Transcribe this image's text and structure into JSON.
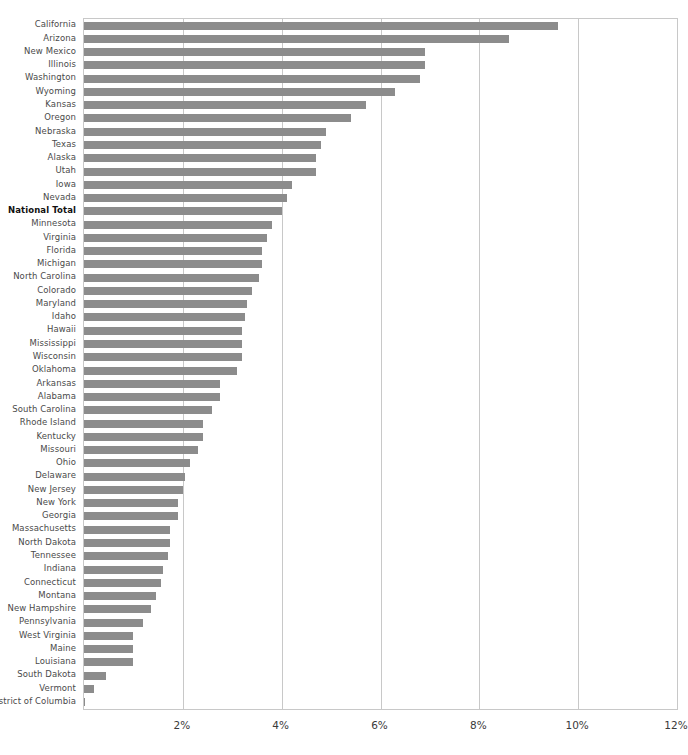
{
  "chart_data": {
    "type": "bar",
    "orientation": "horizontal",
    "title": "",
    "xlabel": "",
    "ylabel": "",
    "xlim": [
      0,
      12
    ],
    "xticks": [
      2,
      4,
      6,
      8,
      10,
      12
    ],
    "xtick_labels": [
      "2%",
      "4%",
      "6%",
      "8%",
      "10%",
      "12%"
    ],
    "grid": "vertical",
    "legend": "none",
    "bar_color": "#8c8c8c",
    "highlight_category": "National Total",
    "categories": [
      "California",
      "Arizona",
      "New Mexico",
      "Illinois",
      "Washington",
      "Wyoming",
      "Kansas",
      "Oregon",
      "Nebraska",
      "Texas",
      "Alaska",
      "Utah",
      "Iowa",
      "Nevada",
      "National Total",
      "Minnesota",
      "Virginia",
      "Florida",
      "Michigan",
      "North Carolina",
      "Colorado",
      "Maryland",
      "Idaho",
      "Hawaii",
      "Mississippi",
      "Wisconsin",
      "Oklahoma",
      "Arkansas",
      "Alabama",
      "South Carolina",
      "Rhode Island",
      "Kentucky",
      "Missouri",
      "Ohio",
      "Delaware",
      "New Jersey",
      "New York",
      "Georgia",
      "Massachusetts",
      "North Dakota",
      "Tennessee",
      "Indiana",
      "Connecticut",
      "Montana",
      "New Hampshire",
      "Pennsylvania",
      "West Virginia",
      "Maine",
      "Louisiana",
      "South Dakota",
      "Vermont",
      "District of Columbia"
    ],
    "values": [
      9.6,
      8.6,
      6.9,
      6.9,
      6.8,
      6.3,
      5.7,
      5.4,
      4.9,
      4.8,
      4.7,
      4.7,
      4.2,
      4.1,
      4.0,
      3.8,
      3.7,
      3.6,
      3.6,
      3.55,
      3.4,
      3.3,
      3.25,
      3.2,
      3.2,
      3.2,
      3.1,
      2.75,
      2.75,
      2.6,
      2.4,
      2.4,
      2.3,
      2.15,
      2.05,
      2.0,
      1.9,
      1.9,
      1.75,
      1.75,
      1.7,
      1.6,
      1.55,
      1.45,
      1.35,
      1.2,
      1.0,
      1.0,
      1.0,
      0.45,
      0.2,
      0.02
    ]
  }
}
